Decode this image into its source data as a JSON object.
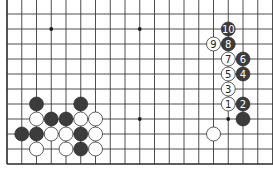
{
  "diagram": {
    "type": "go-board-fragment",
    "grid": {
      "origin_x": 7,
      "origin_y": 14,
      "spacing_x": 14.75,
      "spacing_y": 15,
      "cols": 19,
      "rows": 11,
      "left_edge": true,
      "bottom_edge": true,
      "top_edge": false,
      "right_edge": false
    },
    "colors": {
      "black": "#3c3c3c",
      "white": "#ffffff",
      "line": "#3a3a3a"
    },
    "star_points": [
      {
        "col": 3,
        "row": 1
      },
      {
        "col": 9,
        "row": 1
      },
      {
        "col": 9,
        "row": 7
      },
      {
        "col": 15,
        "row": 7
      }
    ],
    "stones": [
      {
        "color": "black",
        "col": 2,
        "row": 6
      },
      {
        "color": "black",
        "col": 5,
        "row": 6
      },
      {
        "color": "white",
        "col": 2,
        "row": 7
      },
      {
        "color": "black",
        "col": 3,
        "row": 7
      },
      {
        "color": "black",
        "col": 4,
        "row": 7
      },
      {
        "color": "white",
        "col": 5,
        "row": 7
      },
      {
        "color": "white",
        "col": 6,
        "row": 7
      },
      {
        "color": "black",
        "col": 1,
        "row": 8
      },
      {
        "color": "black",
        "col": 2,
        "row": 8
      },
      {
        "color": "white",
        "col": 3,
        "row": 8
      },
      {
        "color": "white",
        "col": 4,
        "row": 8
      },
      {
        "color": "black",
        "col": 5,
        "row": 8
      },
      {
        "color": "white",
        "col": 6,
        "row": 8
      },
      {
        "color": "white",
        "col": 2,
        "row": 9
      },
      {
        "color": "white",
        "col": 4,
        "row": 9
      },
      {
        "color": "black",
        "col": 5,
        "row": 9
      },
      {
        "color": "white",
        "col": 6,
        "row": 9
      },
      {
        "color": "black",
        "col": 16,
        "row": 7
      },
      {
        "color": "white",
        "col": 14,
        "row": 8
      },
      {
        "color": "white",
        "col": 15,
        "row": 6,
        "label": "1"
      },
      {
        "color": "black",
        "col": 16,
        "row": 6,
        "label": "2"
      },
      {
        "color": "white",
        "col": 15,
        "row": 5,
        "label": "3"
      },
      {
        "color": "black",
        "col": 16,
        "row": 4,
        "label": "4"
      },
      {
        "color": "white",
        "col": 15,
        "row": 4,
        "label": "5"
      },
      {
        "color": "black",
        "col": 16,
        "row": 3,
        "label": "6"
      },
      {
        "color": "white",
        "col": 15,
        "row": 3,
        "label": "7"
      },
      {
        "color": "black",
        "col": 15,
        "row": 2,
        "label": "8"
      },
      {
        "color": "white",
        "col": 14,
        "row": 2,
        "label": "9"
      },
      {
        "color": "black",
        "col": 15,
        "row": 1,
        "label": "10"
      }
    ]
  }
}
